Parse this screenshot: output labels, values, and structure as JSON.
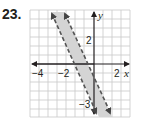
{
  "problem": {
    "number": "23."
  },
  "graph": {
    "x_axis_label": "x",
    "y_axis_label": "y",
    "x_ticks": [
      {
        "label": "−4",
        "value": -4
      },
      {
        "label": "−2",
        "value": -2
      },
      {
        "label": "2",
        "value": 2
      }
    ],
    "y_ticks": [
      {
        "label": "2",
        "value": 2
      },
      {
        "label": "−3",
        "value": -4.5
      }
    ],
    "grid": {
      "x_range": [
        -7,
        4
      ],
      "y_range": [
        -6,
        6
      ],
      "step": 1
    },
    "boundary_lines": [
      {
        "style": "dashed",
        "description": "left boundary, steep negative slope"
      },
      {
        "style": "dashed",
        "description": "right boundary, parallel, steep negative slope"
      }
    ],
    "shaded_region": "between the two dashed lines",
    "colors": {
      "grid": "#c8c8c8",
      "axis": "#231f20",
      "shade": "#d4d4d4",
      "line": "#555555"
    }
  }
}
